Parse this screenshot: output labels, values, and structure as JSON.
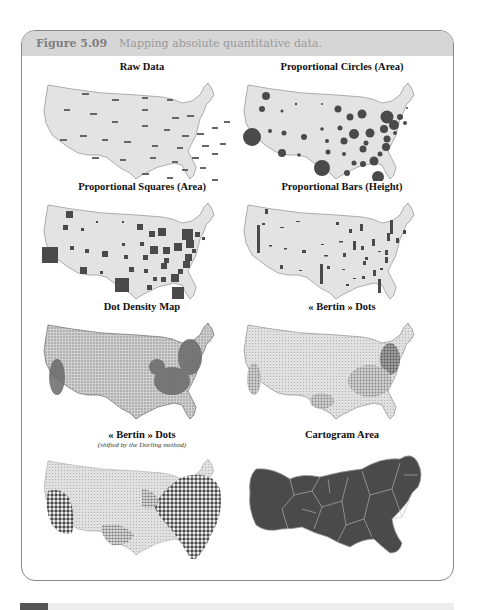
{
  "figure": {
    "label": "Figure 5.09",
    "caption": "Mapping absolute quantitative data."
  },
  "panels": [
    {
      "title": "Raw Data",
      "subtitle": "",
      "style": "raw"
    },
    {
      "title": "Proportional Circles (Area)",
      "subtitle": "",
      "style": "circles"
    },
    {
      "title": "Proportional Squares (Area)",
      "subtitle": "",
      "style": "squares"
    },
    {
      "title": "Proportional Bars (Height)",
      "subtitle": "",
      "style": "bars"
    },
    {
      "title": "Dot Density Map",
      "subtitle": "",
      "style": "dot-density"
    },
    {
      "title": "« Bertin » Dots",
      "subtitle": "",
      "style": "bertin"
    },
    {
      "title": "« Bertin » Dots",
      "subtitle": "(shifted by the Dorling method)",
      "style": "bertin-dorling"
    },
    {
      "title": "Cartogram Area",
      "subtitle": "",
      "style": "cartogram"
    }
  ],
  "colors": {
    "header_bg": "#d6d6d6",
    "map_fill": "#e3e3e3",
    "map_stroke": "#9a9a9a",
    "symbol_fill": "#4a4a4a",
    "cartogram_fill": "#4a4a4a"
  }
}
